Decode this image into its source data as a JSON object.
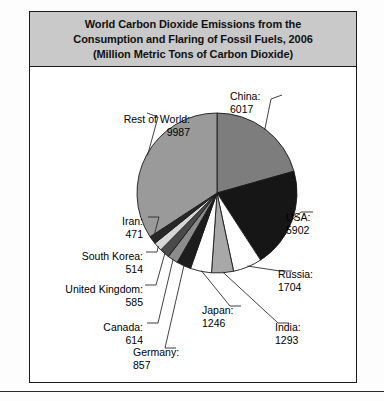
{
  "chart_data": {
    "type": "pie",
    "title": "World Carbon Dioxide Emissions from the Consumption and Flaring of Fossil Fuels, 2006 (Million Metric Tons of Carbon Dioxide)",
    "title_lines": [
      "World Carbon Dioxide Emissions from the",
      "Consumption and Flaring of Fossil Fuels, 2006",
      "(Million Metric Tons of Carbon Dioxide)"
    ],
    "unit": "Million Metric Tons of Carbon Dioxide",
    "year": "2006",
    "total": 29190,
    "legend": "none",
    "grid": false,
    "categories": [
      "China",
      "USA",
      "Russia",
      "India",
      "Japan",
      "Germany",
      "Canada",
      "United Kingdom",
      "South Korea",
      "Iran",
      "Rest of World"
    ],
    "values": [
      6017,
      5902,
      1704,
      1293,
      1246,
      857,
      614,
      585,
      514,
      471,
      9987
    ],
    "slices": [
      {
        "label": "China",
        "value": 6017,
        "text": "China:",
        "value_text": "6017",
        "color": "#7d7d7d"
      },
      {
        "label": "USA",
        "value": 5902,
        "text": "USA:",
        "value_text": "5902",
        "color": "#161616"
      },
      {
        "label": "Russia",
        "value": 1704,
        "text": "Russia:",
        "value_text": "1704",
        "color": "#ffffff"
      },
      {
        "label": "India",
        "value": 1293,
        "text": "India:",
        "value_text": "1293",
        "color": "#a8a8a8"
      },
      {
        "label": "Japan",
        "value": 1246,
        "text": "Japan:",
        "value_text": "1246",
        "color": "#ffffff"
      },
      {
        "label": "Germany",
        "value": 857,
        "text": "Germany:",
        "value_text": "857",
        "color": "#1d1d1d"
      },
      {
        "label": "Canada",
        "value": 614,
        "text": "Canada:",
        "value_text": "614",
        "color": "#8c8c8c"
      },
      {
        "label": "United Kingdom",
        "value": 585,
        "text": "United Kingdom:",
        "value_text": "585",
        "color": "#4a4a4a"
      },
      {
        "label": "South Korea",
        "value": 514,
        "text": "South Korea:",
        "value_text": "514",
        "color": "#d6d6d6"
      },
      {
        "label": "Iran",
        "value": 471,
        "text": "Iran:",
        "value_text": "471",
        "color": "#272727"
      },
      {
        "label": "Rest of World",
        "value": 9987,
        "text": "Rest of World:",
        "value_text": "9987",
        "color": "#9a9a9a"
      }
    ],
    "colors": {
      "title_background": "#c9c9c9",
      "border": "#1a1a1a",
      "plot_background": "#ffffff",
      "leader_line": "#2b2b2b"
    }
  }
}
